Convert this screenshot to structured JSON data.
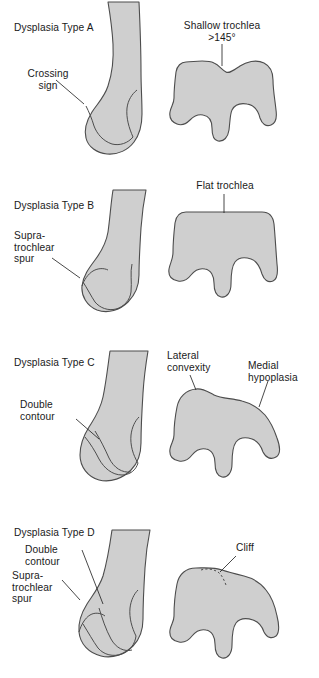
{
  "figure": {
    "colors": {
      "bone_fill": "#cfcfcf",
      "bone_stroke": "#4d4d4d",
      "text": "#1a1a1a",
      "leader_line": "#1a1a1a",
      "background": "#ffffff"
    }
  },
  "panels": [
    {
      "id": "type-a",
      "type_label": "Dysplasia Type A",
      "lateral_view": {
        "name": "lateral-femur-type-a",
        "annotations": [
          {
            "name": "crossing-sign",
            "text": "Crossing\nsign"
          }
        ]
      },
      "axial_view": {
        "name": "axial-femur-type-a",
        "annotations": [
          {
            "name": "shallow-trochlea",
            "text": "Shallow trochlea\n>145°"
          }
        ]
      }
    },
    {
      "id": "type-b",
      "type_label": "Dysplasia Type B",
      "lateral_view": {
        "name": "lateral-femur-type-b",
        "annotations": [
          {
            "name": "supratrochlear-spur",
            "text": "Supra-\ntrochlear\nspur"
          }
        ]
      },
      "axial_view": {
        "name": "axial-femur-type-b",
        "annotations": [
          {
            "name": "flat-trochlea",
            "text": "Flat trochlea"
          }
        ]
      }
    },
    {
      "id": "type-c",
      "type_label": "Dysplasia Type C",
      "lateral_view": {
        "name": "lateral-femur-type-c",
        "annotations": [
          {
            "name": "double-contour",
            "text": "Double\ncontour"
          }
        ]
      },
      "axial_view": {
        "name": "axial-femur-type-c",
        "annotations": [
          {
            "name": "lateral-convexity",
            "text": "Lateral\nconvexity"
          },
          {
            "name": "medial-hypoplasia",
            "text": "Medial\nhypoplasia"
          }
        ]
      }
    },
    {
      "id": "type-d",
      "type_label": "Dysplasia Type D",
      "lateral_view": {
        "name": "lateral-femur-type-d",
        "annotations": [
          {
            "name": "double-contour",
            "text": "Double\ncontour"
          },
          {
            "name": "supratrochlear-spur",
            "text": "Supra-\ntrochlear\nspur"
          }
        ]
      },
      "axial_view": {
        "name": "axial-femur-type-d",
        "annotations": [
          {
            "name": "cliff",
            "text": "Cliff"
          }
        ]
      }
    }
  ]
}
